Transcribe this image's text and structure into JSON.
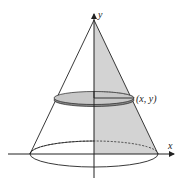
{
  "diagram": {
    "type": "cone-of-revolution",
    "labels": {
      "y_axis": "y",
      "x_axis": "x",
      "point": "(x, y)"
    },
    "colors": {
      "line": "#222222",
      "shade": "#d3d3d3",
      "disk_top": "#c8c8c8",
      "disk_edge": "#8a8a8a"
    }
  }
}
